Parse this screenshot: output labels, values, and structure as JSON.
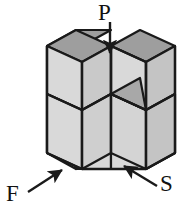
{
  "figure": {
    "background_color": "#ffffff",
    "outline_color": "#1a1a1a",
    "colors": {
      "top_face": "#9e9e9e",
      "front_face": "#d9d9d9",
      "side_face": "#c4c4c4",
      "inner_top_face": "#a8a8a8",
      "arrow": "#1a1a1a",
      "label_text": "#111111"
    },
    "labels": [
      {
        "id": "p",
        "text": "P",
        "arrow_direction": "down",
        "arrow_points_to": "top face of upper-right cube",
        "x": 98,
        "y": 1
      },
      {
        "id": "f",
        "text": "F",
        "arrow_direction": "up-right",
        "arrow_points_to": "front-left bottom cube face",
        "x": 6,
        "y": 182
      },
      {
        "id": "s",
        "text": "S",
        "arrow_direction": "up-left",
        "arrow_points_to": "front bottom-middle cube face",
        "x": 160,
        "y": 172
      }
    ],
    "structure": {
      "description": "Three-wide, two-high arrangement of cubes with the top-middle position empty",
      "cube_count": 5,
      "columns": 3,
      "rows": 2,
      "missing_position": "top-middle"
    }
  }
}
